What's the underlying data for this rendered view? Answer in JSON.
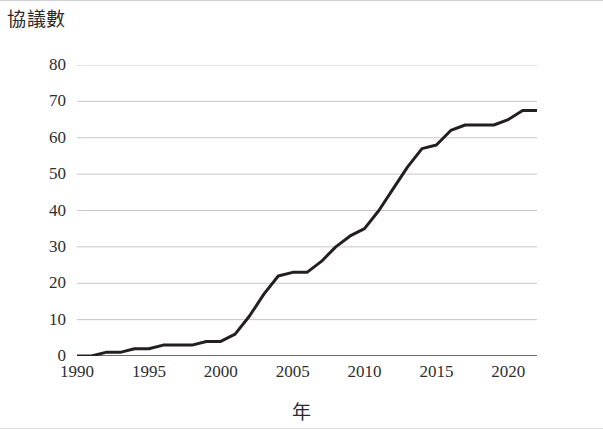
{
  "chart_data": {
    "type": "line",
    "title": "",
    "ylabel": "協議數",
    "xlabel": "年",
    "ylim": [
      0,
      80
    ],
    "xlim": [
      1990,
      2022
    ],
    "ytick_labels": [
      "80",
      "70",
      "60",
      "50",
      "40",
      "30",
      "20",
      "10",
      "0"
    ],
    "ytick_values": [
      80,
      70,
      60,
      50,
      40,
      30,
      20,
      10,
      0
    ],
    "xtick_labels": [
      "1990",
      "1995",
      "2000",
      "2005",
      "2010",
      "2015",
      "2020"
    ],
    "xtick_values": [
      1990,
      1995,
      2000,
      2005,
      2010,
      2015,
      2020
    ],
    "grid": "horizontal",
    "legend": "none",
    "line_color": "#231f20",
    "line_width": 3,
    "x": [
      1990,
      1991,
      1992,
      1993,
      1994,
      1995,
      1996,
      1997,
      1998,
      1999,
      2000,
      2001,
      2002,
      2003,
      2004,
      2005,
      2006,
      2007,
      2008,
      2009,
      2010,
      2011,
      2012,
      2013,
      2014,
      2015,
      2016,
      2017,
      2018,
      2019,
      2020,
      2021,
      2022
    ],
    "values": [
      0,
      0,
      1,
      1,
      2,
      2,
      3,
      3,
      3,
      4,
      4,
      6,
      11,
      17,
      22,
      23,
      23,
      26,
      30,
      33,
      35,
      40,
      46,
      52,
      57,
      58,
      62,
      63.5,
      63.5,
      63.5,
      65,
      67.5,
      67.5
    ],
    "series": [
      {
        "name": "協議數",
        "values": [
          0,
          0,
          1,
          1,
          2,
          2,
          3,
          3,
          3,
          4,
          4,
          6,
          11,
          17,
          22,
          23,
          23,
          26,
          30,
          33,
          35,
          40,
          46,
          52,
          57,
          58,
          62,
          63.5,
          63.5,
          63.5,
          65,
          67.5,
          67.5
        ]
      }
    ],
    "annotations": []
  },
  "axes": {
    "y_title": "協議數",
    "x_title": "年"
  },
  "colors": {
    "line": "#231f20",
    "grid": "#bfbfbf",
    "axis": "#3a3a3a",
    "text": "#2e2e2e",
    "background": "#ffffff"
  }
}
